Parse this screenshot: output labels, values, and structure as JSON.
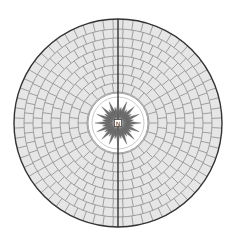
{
  "diagram": {
    "center": {
      "x": 118,
      "y": 123
    },
    "outer_radius": 104,
    "inner_disc_radius": 30,
    "inner_ring_radius": 26,
    "rings": [
      {
        "r_in": 31,
        "r_out": 40,
        "segments": 22
      },
      {
        "r_in": 40,
        "r_out": 49,
        "segments": 28
      },
      {
        "r_in": 49,
        "r_out": 58,
        "segments": 34
      },
      {
        "r_in": 58,
        "r_out": 67,
        "segments": 40
      },
      {
        "r_in": 67,
        "r_out": 76,
        "segments": 46
      },
      {
        "r_in": 76,
        "r_out": 85,
        "segments": 52
      },
      {
        "r_in": 85,
        "r_out": 94,
        "segments": 58
      },
      {
        "r_in": 94,
        "r_out": 104,
        "segments": 64
      }
    ],
    "compass": {
      "rays": 32,
      "long_length": 23,
      "short_length": 16,
      "center_label": "N",
      "center_box_size": 7
    },
    "colors": {
      "paver_fill": "#e6e6e6",
      "joint": "#8c8c8c",
      "outline": "#333333",
      "axis_line": "#222222",
      "ray": "#6e6e6e",
      "disc": "#ffffff",
      "inner_ring": "#bdbdbd"
    }
  },
  "caption": ""
}
